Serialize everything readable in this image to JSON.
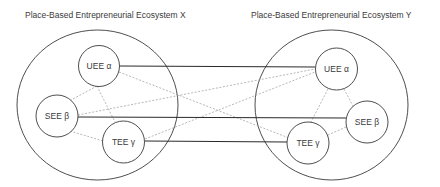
{
  "ecosystems": [
    {
      "id": "X",
      "title": "Place-Based Entrepreneurial Ecosystem X",
      "nodes": [
        {
          "id": "UEE",
          "label": "UEE α"
        },
        {
          "id": "SEE",
          "label": "SEE β"
        },
        {
          "id": "TEE",
          "label": "TEE γ"
        }
      ]
    },
    {
      "id": "Y",
      "title": "Place-Based Entrepreneurial Ecosystem Y",
      "nodes": [
        {
          "id": "UEE",
          "label": "UEE α"
        },
        {
          "id": "SEE",
          "label": "SEE β"
        },
        {
          "id": "TEE",
          "label": "TEE γ"
        }
      ]
    }
  ],
  "links": {
    "solid": [
      {
        "from": "X.UEE",
        "to": "Y.UEE"
      },
      {
        "from": "X.SEE",
        "to": "Y.SEE"
      },
      {
        "from": "X.TEE",
        "to": "Y.TEE"
      }
    ],
    "dashed": [
      {
        "from": "X.UEE",
        "to": "X.SEE"
      },
      {
        "from": "X.UEE",
        "to": "X.TEE"
      },
      {
        "from": "X.SEE",
        "to": "X.TEE"
      },
      {
        "from": "Y.UEE",
        "to": "Y.SEE"
      },
      {
        "from": "Y.UEE",
        "to": "Y.TEE"
      },
      {
        "from": "Y.SEE",
        "to": "Y.TEE"
      },
      {
        "from": "X.UEE",
        "to": "Y.TEE"
      },
      {
        "from": "X.SEE",
        "to": "Y.UEE"
      },
      {
        "from": "X.TEE",
        "to": "Y.UEE"
      }
    ]
  },
  "colors": {
    "outline": "#3a3a3a",
    "solid_link": "#2b2b2b",
    "dashed_link": "#9a9a9a"
  }
}
